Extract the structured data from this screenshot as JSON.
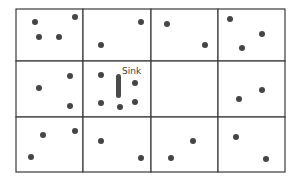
{
  "diagram": {
    "title": "",
    "grid": {
      "rows": 3,
      "cols": 4,
      "x_lines": [
        16,
        83,
        151,
        218,
        285
      ],
      "y_lines": [
        9,
        61,
        117,
        172
      ],
      "line_color": "#3a3a3a"
    },
    "sink": {
      "label": "Sink",
      "x": 116,
      "y": 74,
      "width": 5,
      "height": 24,
      "label_x": 122,
      "label_y": 74,
      "color": "#4a4a4a"
    },
    "nodes": [
      {
        "x": 35,
        "y": 22
      },
      {
        "x": 75,
        "y": 17
      },
      {
        "x": 39,
        "y": 37
      },
      {
        "x": 59,
        "y": 37
      },
      {
        "x": 101,
        "y": 45
      },
      {
        "x": 141,
        "y": 22
      },
      {
        "x": 167,
        "y": 24
      },
      {
        "x": 205,
        "y": 45
      },
      {
        "x": 230,
        "y": 19
      },
      {
        "x": 262,
        "y": 34
      },
      {
        "x": 242,
        "y": 48
      },
      {
        "x": 39,
        "y": 88
      },
      {
        "x": 70,
        "y": 76
      },
      {
        "x": 70,
        "y": 106
      },
      {
        "x": 101,
        "y": 75
      },
      {
        "x": 135,
        "y": 83
      },
      {
        "x": 101,
        "y": 103
      },
      {
        "x": 120,
        "y": 107
      },
      {
        "x": 135,
        "y": 102
      },
      {
        "x": 262,
        "y": 90
      },
      {
        "x": 239,
        "y": 99
      },
      {
        "x": 43,
        "y": 135
      },
      {
        "x": 75,
        "y": 131
      },
      {
        "x": 31,
        "y": 157
      },
      {
        "x": 101,
        "y": 141
      },
      {
        "x": 141,
        "y": 158
      },
      {
        "x": 193,
        "y": 141
      },
      {
        "x": 171,
        "y": 158
      },
      {
        "x": 236,
        "y": 137
      },
      {
        "x": 266,
        "y": 159
      }
    ],
    "node_color": "#454545",
    "node_radius": 3
  }
}
